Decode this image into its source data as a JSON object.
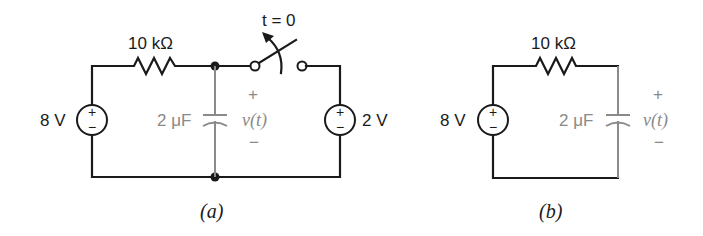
{
  "figure": {
    "circuit_a": {
      "caption": "(a)",
      "resistor_label": "10 kΩ",
      "source_left_label": "8 V",
      "source_right_label": "2 V",
      "capacitor_label": "2 μF",
      "switch_label": "t = 0",
      "voltage_label": "v(t)",
      "plus": "+",
      "minus": "−"
    },
    "circuit_b": {
      "caption": "(b)",
      "resistor_label": "10 kΩ",
      "source_label": "8 V",
      "capacitor_label": "2 μF",
      "voltage_label": "v(t)",
      "plus": "+",
      "minus": "−"
    },
    "colors": {
      "wire": "#1a1a1a",
      "capacitor": "#8a8a8a"
    }
  }
}
